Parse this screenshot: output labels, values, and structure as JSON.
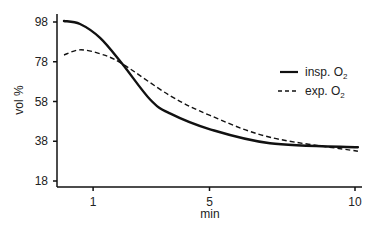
{
  "chart_data": {
    "type": "line",
    "title": "",
    "xlabel": "min",
    "ylabel": "vol %",
    "xlim": [
      -0.25,
      10.2
    ],
    "ylim": [
      18,
      98
    ],
    "x_ticks": [
      1,
      5,
      10
    ],
    "y_ticks": [
      18,
      38,
      58,
      78,
      98
    ],
    "grid": false,
    "legend_position": "upper right",
    "series": [
      {
        "name": "insp. O2",
        "style": "solid",
        "color": "#111111",
        "x": [
          0,
          0.55,
          1.24,
          2.0,
          2.96,
          3.64,
          5.02,
          7.08,
          10.1
        ],
        "y": [
          98.5,
          97,
          90,
          77,
          59,
          52,
          44,
          37,
          35
        ]
      },
      {
        "name": "exp. O2",
        "style": "dashed",
        "color": "#111111",
        "x": [
          0,
          0.55,
          1.24,
          2.0,
          3.64,
          5.02,
          7.08,
          10.1
        ],
        "y": [
          81.4,
          84,
          82,
          77,
          61,
          51,
          40,
          33
        ]
      }
    ]
  },
  "axes": {
    "x_title": "min",
    "y_title": "vol %",
    "x_tick_labels": [
      "1",
      "5",
      "10"
    ],
    "y_tick_labels": [
      "98",
      "78",
      "58",
      "38",
      "18"
    ]
  },
  "legend": {
    "items": [
      {
        "label": "insp. O",
        "sub": "2",
        "style": "solid"
      },
      {
        "label": "exp. O",
        "sub": "2",
        "style": "dashed"
      }
    ]
  }
}
